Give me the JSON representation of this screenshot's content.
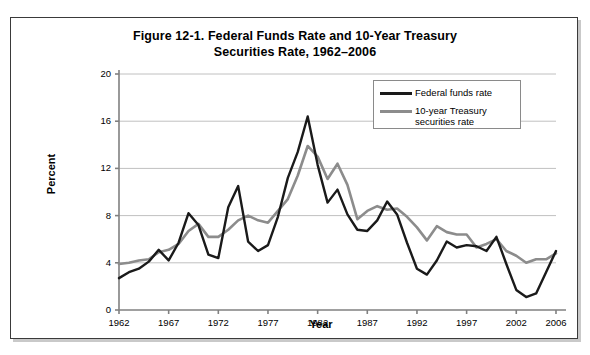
{
  "figure": {
    "title_line1": "Figure 12-1. Federal Funds Rate and 10-Year Treasury",
    "title_line2": "Securities Rate, 1962–2006"
  },
  "axes": {
    "y_title": "Percent",
    "x_title": "Year",
    "y_ticks": [
      "0",
      "4",
      "8",
      "12",
      "16",
      "20"
    ],
    "x_ticks": [
      "1962",
      "1967",
      "1972",
      "1977",
      "1982",
      "1987",
      "1992",
      "1997",
      "2002",
      "2006"
    ]
  },
  "legend": {
    "position": "inside-top-right",
    "items": [
      {
        "label": "Federal funds rate",
        "color": "#1a1a1a"
      },
      {
        "label": "10-year Treasury\nsecurities rate",
        "label_line1": "10-year Treasury",
        "label_line2": "securities rate",
        "color": "#8c8c8c"
      }
    ]
  },
  "colors": {
    "federal_funds": "#1a1a1a",
    "treasury": "#8c8c8c",
    "gridline": "#c0c0c0",
    "axis": "#808080",
    "frame": "#3a3a3a"
  },
  "chart_data": {
    "type": "line",
    "title": "Figure 12-1. Federal Funds Rate and 10-Year Treasury Securities Rate, 1962–2006",
    "xlabel": "Year",
    "ylabel": "Percent",
    "xlim": [
      1962,
      2006
    ],
    "ylim": [
      0,
      20
    ],
    "y_ticks": [
      0,
      4,
      8,
      12,
      16,
      20
    ],
    "x_ticks": [
      1962,
      1967,
      1972,
      1977,
      1982,
      1987,
      1992,
      1997,
      2002,
      2006
    ],
    "grid": "horizontal",
    "legend_position": "upper right",
    "x": [
      1962,
      1963,
      1964,
      1965,
      1966,
      1967,
      1968,
      1969,
      1970,
      1971,
      1972,
      1973,
      1974,
      1975,
      1976,
      1977,
      1978,
      1979,
      1980,
      1981,
      1982,
      1983,
      1984,
      1985,
      1986,
      1987,
      1988,
      1989,
      1990,
      1991,
      1992,
      1993,
      1994,
      1995,
      1996,
      1997,
      1998,
      1999,
      2000,
      2001,
      2002,
      2003,
      2004,
      2005,
      2006
    ],
    "series": [
      {
        "name": "Federal funds rate",
        "color": "#1a1a1a",
        "values": [
          2.7,
          3.2,
          3.5,
          4.1,
          5.1,
          4.2,
          5.7,
          8.2,
          7.2,
          4.7,
          4.4,
          8.7,
          10.5,
          5.8,
          5.0,
          5.5,
          7.9,
          11.2,
          13.4,
          16.4,
          12.3,
          9.1,
          10.2,
          8.1,
          6.8,
          6.7,
          7.6,
          9.2,
          8.1,
          5.7,
          3.5,
          3.0,
          4.2,
          5.8,
          5.3,
          5.5,
          5.4,
          5.0,
          6.2,
          3.9,
          1.7,
          1.1,
          1.4,
          3.2,
          5.0
        ]
      },
      {
        "name": "10-year Treasury securities rate",
        "color": "#8c8c8c",
        "values": [
          3.9,
          4.0,
          4.2,
          4.3,
          4.9,
          5.1,
          5.6,
          6.7,
          7.3,
          6.2,
          6.2,
          6.8,
          7.6,
          8.0,
          7.6,
          7.4,
          8.4,
          9.4,
          11.4,
          13.9,
          13.0,
          11.1,
          12.4,
          10.6,
          7.7,
          8.4,
          8.8,
          8.5,
          8.6,
          7.9,
          7.0,
          5.9,
          7.1,
          6.6,
          6.4,
          6.4,
          5.3,
          5.6,
          6.0,
          5.0,
          4.6,
          4.0,
          4.3,
          4.3,
          4.8
        ]
      }
    ]
  }
}
